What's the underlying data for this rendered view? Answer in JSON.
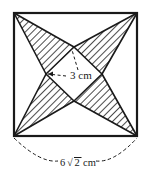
{
  "figure": {
    "outer_shape": {
      "name": "outer-square",
      "type": "square",
      "side_label": "6√2 cm",
      "side_label_parts": {
        "coefficient": "6",
        "radical": "√",
        "radicand": "2",
        "unit": "cm"
      }
    },
    "inner_shape": {
      "name": "inner-square-diamond",
      "type": "square-rotated-45",
      "side_label": "3 cm",
      "side_label_parts": {
        "value": "3",
        "unit": "cm"
      }
    },
    "shading": {
      "hatched_region_name": "hatched-shaded-region",
      "hatch_angle_degrees": 45,
      "hatch_color": "#2b2b2b",
      "white_region_color": "#ffffff"
    },
    "colors": {
      "stroke": "#1a1a1a",
      "hatch": "#2b2b2b",
      "fill_white": "#ffffff",
      "background": "#ffffff",
      "leader_dash": "#1a1a1a"
    },
    "geometry": {
      "outer_square": {
        "top_left": [
          14,
          13
        ],
        "top_right": [
          137,
          13
        ],
        "bottom_right": [
          137,
          136
        ],
        "bottom_left": [
          14,
          136
        ]
      },
      "inner_diamond": {
        "top": [
          74,
          47
        ],
        "right": [
          102,
          74
        ],
        "bottom": [
          74,
          101
        ],
        "left": [
          46,
          74
        ]
      },
      "white_triangles": [
        {
          "name": "white-triangle-left",
          "apex": [
            46,
            74
          ],
          "base": [
            [
              14,
              13
            ],
            [
              14,
              136
            ]
          ]
        },
        {
          "name": "white-triangle-top",
          "apex": [
            74,
            47
          ],
          "base": [
            [
              14,
              13
            ],
            [
              137,
              13
            ]
          ]
        },
        {
          "name": "white-triangle-right",
          "apex": [
            102,
            74
          ],
          "base": [
            [
              137,
              13
            ],
            [
              137,
              136
            ]
          ]
        },
        {
          "name": "white-triangle-bottom",
          "apex": [
            74,
            101
          ],
          "base": [
            [
              14,
              136
            ],
            [
              137,
              136
            ]
          ]
        }
      ]
    },
    "labels": {
      "inner_label": {
        "name": "inner-dimension-label",
        "text": "3 cm",
        "x": 70,
        "y": 78
      },
      "outer_label": {
        "name": "outer-dimension-label",
        "text": "6√2 cm",
        "x": 76,
        "y": 166
      }
    }
  }
}
